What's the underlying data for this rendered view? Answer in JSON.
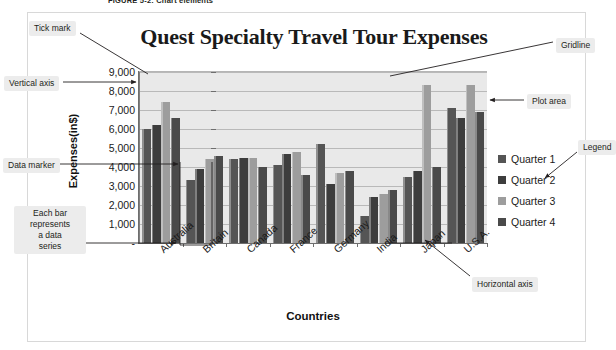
{
  "figure": {
    "caption": "FIGURE 5-2: Chart elements"
  },
  "chart_data": {
    "type": "bar",
    "title": "Quest Specialty Travel Tour Expenses",
    "xlabel": "Countries",
    "ylabel": "Expenses(in$)",
    "categories": [
      "Australia",
      "Britain",
      "Canada",
      "France",
      "Germany",
      "India",
      "Japan",
      "U.S.A."
    ],
    "series": [
      {
        "name": "Quarter 1",
        "color": "#555555",
        "values": [
          6000,
          3300,
          4400,
          4100,
          5200,
          1400,
          3500,
          7100
        ]
      },
      {
        "name": "Quarter 2",
        "color": "#3d3d3d",
        "values": [
          6200,
          3900,
          4500,
          4700,
          3100,
          2400,
          3800,
          6600
        ]
      },
      {
        "name": "Quarter 3",
        "color": "#9d9d9d",
        "values": [
          7400,
          4400,
          4500,
          4800,
          3700,
          2600,
          8300,
          8300
        ]
      },
      {
        "name": "Quarter 4",
        "color": "#4a4a4a",
        "values": [
          6600,
          4600,
          4000,
          3600,
          3800,
          2800,
          4000,
          6900
        ]
      }
    ],
    "ylim": [
      0,
      9000
    ],
    "ytick_labels": [
      "9,000",
      "8,000",
      "7,000",
      "6,000",
      "5,000",
      "4,000",
      "3,000",
      "2,000",
      "1,000",
      "-"
    ],
    "ytick_values": [
      9000,
      8000,
      7000,
      6000,
      5000,
      4000,
      3000,
      2000,
      1000,
      0
    ],
    "grid": true,
    "legend_position": "right",
    "plot_area_color": "#e9e9e9"
  },
  "annotations": [
    {
      "key": "tick_mark",
      "label": "Tick mark"
    },
    {
      "key": "gridline",
      "label": "Gridline"
    },
    {
      "key": "vertical_axis",
      "label": "Vertical axis"
    },
    {
      "key": "plot_area",
      "label": "Plot area"
    },
    {
      "key": "data_marker",
      "label": "Data marker"
    },
    {
      "key": "legend",
      "label": "Legend"
    },
    {
      "key": "data_series",
      "label": "Each bar\nrepresents\na data\nseries"
    },
    {
      "key": "horizontal_axis",
      "label": "Horizontal axis"
    }
  ],
  "legend": {
    "items": [
      {
        "label": "Quarter 1",
        "color": "#555555"
      },
      {
        "label": "Quarter 2",
        "color": "#3d3d3d"
      },
      {
        "label": "Quarter 3",
        "color": "#9d9d9d"
      },
      {
        "label": "Quarter 4",
        "color": "#4a4a4a"
      }
    ]
  }
}
